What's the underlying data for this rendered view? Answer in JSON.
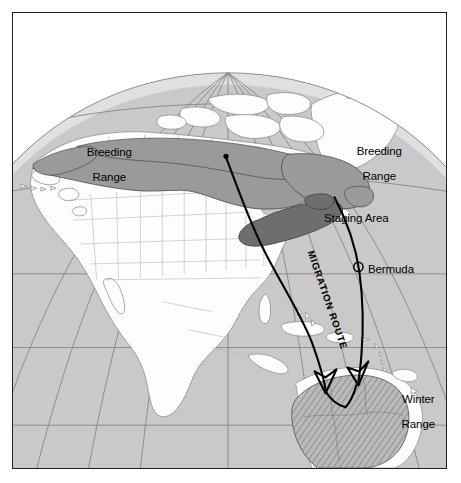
{
  "figure": {
    "kind": "migration-range-map",
    "region": "North America and northern South America",
    "projection": "orthographic globe with graticule"
  },
  "colors": {
    "frame": "#231f20",
    "page_background": "#ffffff",
    "ocean": "#c9c9c9",
    "land": "#fefefe",
    "land_outline": "#8a8a8a",
    "graticule": "#7d7d7d",
    "globe_limb_shade": "#dcdcdc",
    "breeding_range": "#9a9a9a",
    "staging_area": "#6e6e6e",
    "winter_range_fill": "#b4b4b4",
    "winter_range_hatch": "#6f6f6f",
    "route_line": "#000000"
  },
  "labels": {
    "breeding_west": {
      "line1": "Breeding",
      "line2": "Range"
    },
    "breeding_east": {
      "line1": "Breeding",
      "line2": "Range"
    },
    "staging_area": "Staging Area",
    "bermuda": "Bermuda",
    "winter_range": {
      "line1": "Winter",
      "line2": "Range"
    },
    "migration_route": "MIGRATION ROUTE"
  },
  "markers": {
    "bermuda_symbol": "open-circle",
    "route_origin_symbol": "filled-dot"
  },
  "route": {
    "name": "MIGRATION ROUTE",
    "origin": "James Bay / northern Ontario",
    "arrowheads": 2,
    "destination": "Winter Range, northern South America"
  }
}
